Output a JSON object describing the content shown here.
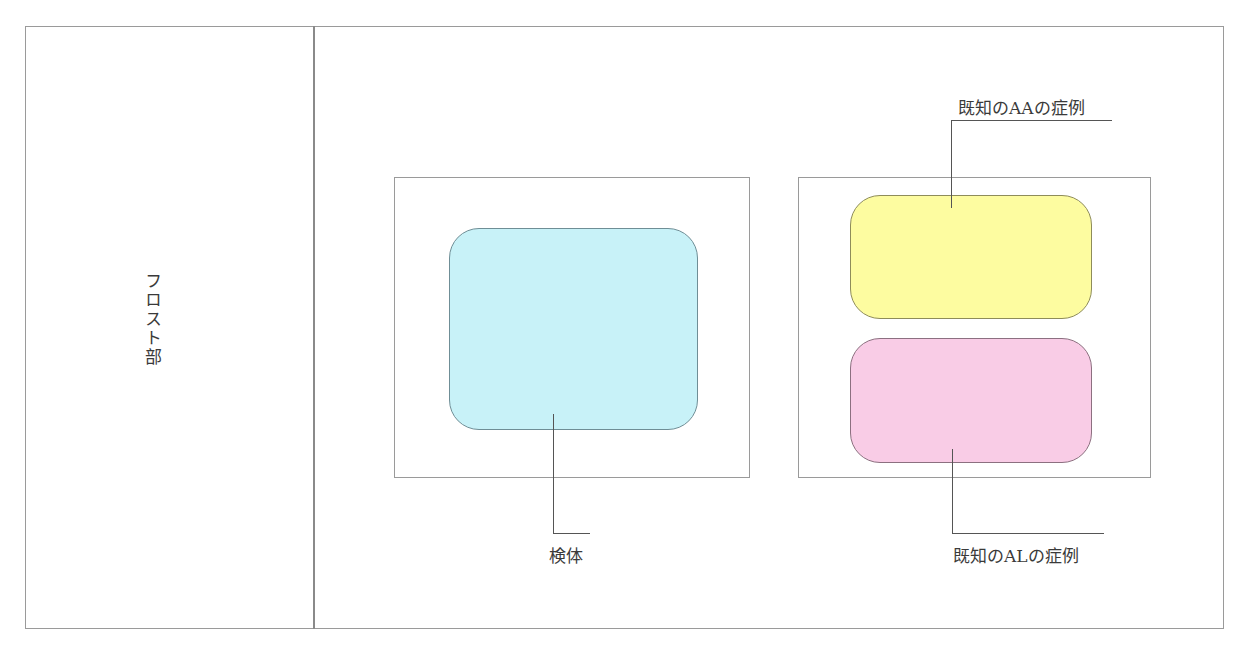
{
  "diagram": {
    "frost_label": "フロスト部",
    "specimen_label": "検体",
    "known_aa_label": "既知のAAの症例",
    "known_al_label": "既知のALの症例"
  },
  "colors": {
    "specimen_fill": "#c8f2f8",
    "specimen_border": "#6f8e96",
    "aa_fill": "#fdfca0",
    "aa_border": "#8e8c5a",
    "al_fill": "#f9cce6",
    "al_border": "#8c7080",
    "frame": "#9a9a9a"
  }
}
